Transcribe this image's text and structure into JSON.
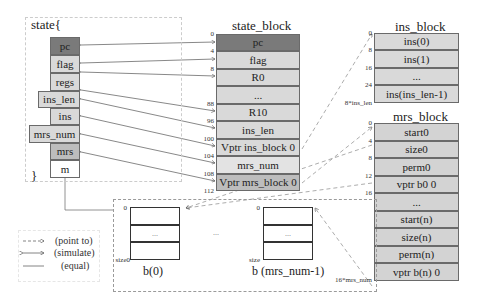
{
  "colors": {
    "dark": "#7a7a7a",
    "mid": "#bdbdbd",
    "light": "#d9d9d9",
    "white": "#ffffff",
    "line": "#6a6a6a"
  },
  "state": {
    "title": "state{",
    "close": "}",
    "fields": [
      {
        "label": "pc",
        "shade": "dark"
      },
      {
        "label": "flag",
        "shade": "light"
      },
      {
        "label": "regs",
        "shade": "light"
      },
      {
        "label": "ins_len",
        "shade": "light"
      },
      {
        "label": "ins",
        "shade": "light"
      },
      {
        "label": "mrs_num",
        "shade": "light"
      },
      {
        "label": "mrs",
        "shade": "mid"
      },
      {
        "label": "m",
        "shade": "white"
      }
    ]
  },
  "state_block": {
    "title": "state_block",
    "rows": [
      "pc",
      "flag",
      "R0",
      "...",
      "R10",
      "ins_len",
      "Vptr ins_block 0",
      "mrs_num",
      "Vptr mrs_block 0"
    ],
    "offsets": [
      "0",
      "4",
      "8",
      "88",
      "96",
      "100",
      "104",
      "108",
      "112"
    ]
  },
  "ins_block": {
    "title": "ins_block",
    "rows": [
      "ins(0)",
      "ins(1)",
      "...",
      "ins(ins_len-1)"
    ],
    "offsets": [
      "0",
      "8",
      "16",
      "24",
      "8*ins_len"
    ]
  },
  "mrs_block": {
    "title": "mrs_block",
    "rows": [
      "start0",
      "size0",
      "perm0",
      "vptr b0 0",
      "...",
      "start(n)",
      "size(n)",
      "perm(n)",
      "vptr b(n) 0"
    ],
    "offsets": [
      "0",
      "4",
      "8",
      "12",
      "16",
      "16*mrs_num"
    ]
  },
  "buffers": {
    "items": [
      {
        "label": "b(0)",
        "rows": [
          "",
          "...",
          ""
        ],
        "top_offset": "0",
        "bottom_offset": "size0"
      },
      {
        "label": "b (mrs_num-1)",
        "rows": [
          "",
          "...",
          ""
        ],
        "top_offset": "0",
        "bottom_offset": "size"
      }
    ],
    "between": "..."
  },
  "legend": {
    "items": [
      {
        "symbol": "- - >",
        "label": "(point to)"
      },
      {
        "symbol": "<-->",
        "label": "(simulate)"
      },
      {
        "symbol": "——",
        "label": "(equal)"
      }
    ]
  }
}
